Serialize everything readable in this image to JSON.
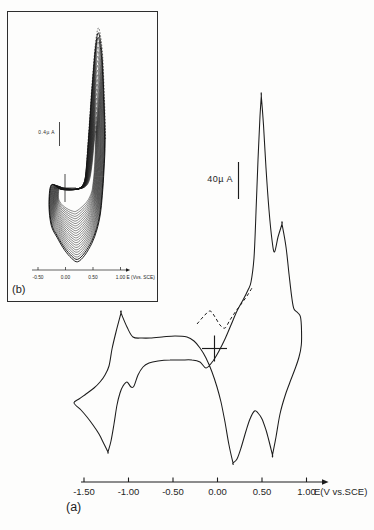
{
  "figure": {
    "panel_a_label": "(a)",
    "panel_b_label": "(b)"
  },
  "chart_data": [
    {
      "id": "main",
      "panel": "(a)",
      "type": "line",
      "title": "Cyclic voltammogram, single scan",
      "xlabel": "E(V vs.SCE)",
      "x_ticks": [
        -1.5,
        -1.0,
        -0.5,
        0.0,
        0.5,
        1.0
      ],
      "x_tick_labels": [
        "-1.50",
        "-1.00",
        "-0.50",
        "0.00",
        "0.50",
        "1.00"
      ],
      "x_range_V": [
        -1.61,
        0.96
      ],
      "scale_bar": {
        "label": "40µ A",
        "value_uA": 40
      },
      "origin_marker": "cross at E = 0 V, I = 0",
      "anodic_peaks_V": [
        -1.09,
        0.49,
        0.73
      ],
      "anodic_prepeak_dashed_V": -0.08,
      "cathodic_peaks_V": [
        -1.23,
        0.17,
        0.62
      ],
      "loop_EI": [
        [
          -1.612,
          -60.6
        ],
        [
          -1.534,
          -68.3
        ],
        [
          -1.466,
          -76.0
        ],
        [
          -1.399,
          -84.8
        ],
        [
          -1.331,
          -94.8
        ],
        [
          -1.275,
          -105.8
        ],
        [
          -1.23,
          -114.6
        ],
        [
          -1.23,
          -114.6
        ],
        [
          -1.197,
          -102.5
        ],
        [
          -1.163,
          -83.7
        ],
        [
          -1.129,
          -62.8
        ],
        [
          -1.096,
          -49.6
        ],
        [
          -1.062,
          -41.9
        ],
        [
          -1.017,
          -37.5
        ],
        [
          -0.972,
          -43.0
        ],
        [
          -0.938,
          -41.9
        ],
        [
          -0.893,
          -29.8
        ],
        [
          -0.837,
          -20.9
        ],
        [
          -0.77,
          -16.5
        ],
        [
          -0.669,
          -14.3
        ],
        [
          -0.534,
          -13.2
        ],
        [
          -0.41,
          -13.2
        ],
        [
          -0.287,
          -13.2
        ],
        [
          -0.197,
          -15.4
        ],
        [
          -0.129,
          -22.0
        ],
        [
          -0.051,
          -14.3
        ],
        [
          0.017,
          -3.3
        ],
        [
          0.084,
          9.9
        ],
        [
          0.152,
          25.3
        ],
        [
          0.219,
          40.8
        ],
        [
          0.287,
          52.9
        ],
        [
          0.343,
          63.9
        ],
        [
          0.376,
          72.7
        ],
        [
          0.41,
          99.2
        ],
        [
          0.433,
          149.9
        ],
        [
          0.455,
          207.2
        ],
        [
          0.478,
          255.6
        ],
        [
          0.492,
          277.7
        ],
        [
          0.492,
          277.7
        ],
        [
          0.517,
          245.7
        ],
        [
          0.545,
          198.3
        ],
        [
          0.579,
          152.1
        ],
        [
          0.612,
          119.0
        ],
        [
          0.64,
          105.8
        ],
        [
          0.68,
          122.3
        ],
        [
          0.725,
          136.6
        ],
        [
          0.725,
          136.6
        ],
        [
          0.77,
          111.3
        ],
        [
          0.803,
          81.5
        ],
        [
          0.837,
          54.0
        ],
        [
          0.86,
          43.0
        ],
        [
          0.904,
          38.6
        ],
        [
          0.933,
          34.2
        ],
        [
          0.944,
          19.8
        ],
        [
          0.942,
          3.3
        ],
        [
          0.916,
          -9.9
        ],
        [
          0.871,
          -23.1
        ],
        [
          0.815,
          -37.5
        ],
        [
          0.758,
          -52.9
        ],
        [
          0.702,
          -72.7
        ],
        [
          0.657,
          -98.1
        ],
        [
          0.618,
          -117.9
        ],
        [
          0.618,
          -117.9
        ],
        [
          0.579,
          -102.5
        ],
        [
          0.545,
          -90.4
        ],
        [
          0.5,
          -78.2
        ],
        [
          0.455,
          -71.6
        ],
        [
          0.416,
          -69.4
        ],
        [
          0.365,
          -78.2
        ],
        [
          0.32,
          -91.5
        ],
        [
          0.264,
          -110.2
        ],
        [
          0.219,
          -122.3
        ],
        [
          0.174,
          -126.7
        ],
        [
          0.174,
          -126.7
        ],
        [
          0.129,
          -106.9
        ],
        [
          0.084,
          -81.5
        ],
        [
          0.039,
          -59.5
        ],
        [
          -0.006,
          -43.0
        ],
        [
          -0.062,
          -26.4
        ],
        [
          -0.129,
          -11.0
        ],
        [
          -0.197,
          0.0
        ],
        [
          -0.264,
          7.7
        ],
        [
          -0.343,
          12.1
        ],
        [
          -0.478,
          13.2
        ],
        [
          -0.624,
          12.1
        ],
        [
          -0.758,
          11.0
        ],
        [
          -0.848,
          11.0
        ],
        [
          -0.949,
          12.1
        ],
        [
          -1.017,
          23.1
        ],
        [
          -1.084,
          38.6
        ],
        [
          -1.084,
          38.6
        ],
        [
          -1.14,
          17.6
        ],
        [
          -1.185,
          -1.1
        ],
        [
          -1.219,
          -19.8
        ],
        [
          -1.264,
          -29.8
        ],
        [
          -1.32,
          -37.5
        ],
        [
          -1.388,
          -44.1
        ],
        [
          -1.478,
          -50.7
        ],
        [
          -1.556,
          -56.2
        ]
      ],
      "dashed_EI": [
        [
          -0.23,
          26.4
        ],
        [
          -0.152,
          35.3
        ],
        [
          -0.084,
          40.8
        ],
        [
          -0.028,
          34.2
        ],
        [
          0.028,
          25.3
        ],
        [
          0.084,
          22.0
        ],
        [
          0.14,
          30.9
        ],
        [
          0.208,
          40.8
        ],
        [
          0.275,
          49.6
        ],
        [
          0.331,
          57.3
        ],
        [
          0.388,
          66.1
        ]
      ]
    },
    {
      "id": "inset",
      "panel": "(b)",
      "type": "line",
      "title": "Repetitive-scan cyclic voltammograms (film growth)",
      "xlabel": "E (Vvs. SCE)",
      "x_ticks": [
        -0.5,
        0.0,
        0.5,
        1.0
      ],
      "x_tick_labels": [
        "-0.50",
        "0.00",
        "0.50",
        "1.00"
      ],
      "x_range_V": [
        -0.3,
        0.72
      ],
      "scale_bar": {
        "label": "0.4µ A",
        "value_uA": 0.4
      },
      "origin_marker": "cross at E = 0 V, I = 0",
      "n_scans": 22,
      "anodic_peak_V": 0.59,
      "cathodic_minimum_V": 0.22,
      "inner_EI": [
        [
          -0.11,
          0.01
        ],
        [
          -0.13,
          -0.13
        ],
        [
          -0.11,
          -0.22
        ],
        [
          -0.04,
          -0.3
        ],
        [
          0.06,
          -0.36
        ],
        [
          0.13,
          -0.385
        ],
        [
          0.185,
          -0.39
        ],
        [
          0.28,
          -0.33
        ],
        [
          0.38,
          -0.24
        ],
        [
          0.44,
          -0.15
        ],
        [
          0.48,
          -0.05
        ],
        [
          0.5,
          0.07
        ],
        [
          0.52,
          0.25
        ],
        [
          0.535,
          0.48
        ],
        [
          0.545,
          0.72
        ],
        [
          0.553,
          0.88
        ],
        [
          0.553,
          0.93
        ],
        [
          0.55,
          0.95
        ],
        [
          0.53,
          0.83
        ],
        [
          0.5,
          0.55
        ],
        [
          0.47,
          0.3
        ],
        [
          0.43,
          0.12
        ],
        [
          0.37,
          0.03
        ],
        [
          0.27,
          -0.01
        ],
        [
          0.12,
          -0.02
        ],
        [
          -0.04,
          0.0
        ]
      ],
      "outer_EI": [
        [
          -0.26,
          0.05
        ],
        [
          -0.3,
          -0.28
        ],
        [
          -0.26,
          -0.62
        ],
        [
          -0.15,
          -0.83
        ],
        [
          -0.02,
          -1.03
        ],
        [
          0.11,
          -1.17
        ],
        [
          0.22,
          -1.23
        ],
        [
          0.35,
          -1.12
        ],
        [
          0.48,
          -0.92
        ],
        [
          0.57,
          -0.7
        ],
        [
          0.63,
          -0.45
        ],
        [
          0.67,
          -0.12
        ],
        [
          0.7,
          0.3
        ],
        [
          0.72,
          0.8
        ],
        [
          0.7,
          1.47
        ],
        [
          0.67,
          2.13
        ],
        [
          0.63,
          2.47
        ],
        [
          0.59,
          2.58
        ],
        [
          0.54,
          2.3
        ],
        [
          0.48,
          1.63
        ],
        [
          0.43,
          0.97
        ],
        [
          0.39,
          0.47
        ],
        [
          0.35,
          0.13
        ],
        [
          0.26,
          0.0
        ],
        [
          0.11,
          -0.03
        ],
        [
          -0.09,
          -0.02
        ]
      ]
    }
  ]
}
